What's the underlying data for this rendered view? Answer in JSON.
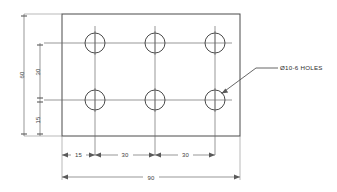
{
  "drawing": {
    "title": "plate-with-six-holes",
    "view": "front-view",
    "units": "mm",
    "line_color": "#4a4a4a",
    "dim_color": "#6b6b6b",
    "text_color": "#3d3d3d",
    "background": "#ffffff"
  },
  "plate": {
    "name": "rectangular-plate",
    "width_value": "90",
    "height_value": "60"
  },
  "holes": {
    "count": 6,
    "rows": 2,
    "columns": 3,
    "diameter": "10",
    "items": [
      {
        "id": "hole-top-left",
        "row": "top",
        "column": "left"
      },
      {
        "id": "hole-top-middle",
        "row": "top",
        "column": "middle"
      },
      {
        "id": "hole-top-right",
        "row": "top",
        "column": "right"
      },
      {
        "id": "hole-bottom-left",
        "row": "bottom",
        "column": "left"
      },
      {
        "id": "hole-bottom-middle",
        "row": "bottom",
        "column": "middle"
      },
      {
        "id": "hole-bottom-right",
        "row": "bottom",
        "column": "right"
      }
    ]
  },
  "dimensions": {
    "vertical": {
      "overall_height": "60",
      "row_spacing": "30",
      "bottom_offset": "15"
    },
    "horizontal": {
      "edge_to_first_hole": "15",
      "first_to_second_hole": "30",
      "second_to_third_hole": "30",
      "overall_width": "90"
    }
  },
  "annotation": {
    "hole_note": "Ø10-6 HOLES"
  }
}
